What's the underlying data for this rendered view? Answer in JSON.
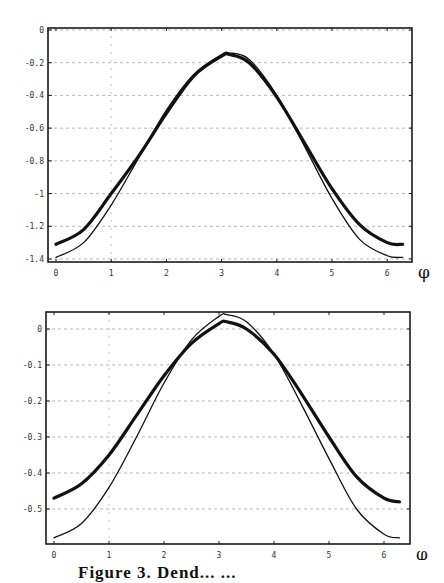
{
  "figure": {
    "caption_partial": "Figure 3. Dend... ...",
    "x_symbol": "φ"
  },
  "chart_data": [
    {
      "type": "line",
      "title": "",
      "xlabel": "φ",
      "ylabel": "",
      "xlim": [
        0,
        6.3
      ],
      "ylim": [
        -1.4,
        0
      ],
      "x_ticks": [
        "0",
        "1",
        "2",
        "3",
        "4",
        "5",
        "6"
      ],
      "y_ticks": [
        "0",
        "-0.2",
        "-0.4",
        "-0.6",
        "-0.8",
        "-1",
        "-1.2",
        "-1.4"
      ],
      "grid": true,
      "legend": null,
      "x": [
        0.0,
        0.5,
        1.0,
        1.5,
        2.0,
        2.5,
        3.0,
        3.14,
        3.5,
        4.0,
        4.5,
        5.0,
        5.5,
        6.0,
        6.28
      ],
      "series": [
        {
          "name": "thick curve",
          "style": "thick",
          "values": [
            -1.31,
            -1.22,
            -1.0,
            -0.77,
            -0.51,
            -0.28,
            -0.16,
            -0.15,
            -0.2,
            -0.41,
            -0.69,
            -0.97,
            -1.19,
            -1.3,
            -1.31
          ]
        },
        {
          "name": "thin curve",
          "style": "thin",
          "values": [
            -1.39,
            -1.3,
            -1.07,
            -0.78,
            -0.49,
            -0.27,
            -0.15,
            -0.14,
            -0.18,
            -0.4,
            -0.71,
            -1.03,
            -1.28,
            -1.38,
            -1.39
          ]
        }
      ]
    },
    {
      "type": "line",
      "title": "",
      "xlabel": "φ",
      "ylabel": "",
      "xlim": [
        0,
        6.3
      ],
      "ylim": [
        -0.58,
        0.05
      ],
      "x_ticks": [
        "0",
        "1",
        "2",
        "3",
        "4",
        "5",
        "6"
      ],
      "y_ticks": [
        "0",
        "-0.1",
        "-0.2",
        "-0.3",
        "-0.4",
        "-0.5"
      ],
      "grid": true,
      "legend": null,
      "x": [
        0.0,
        0.5,
        1.0,
        1.5,
        2.0,
        2.5,
        3.0,
        3.14,
        3.5,
        4.0,
        4.5,
        5.0,
        5.5,
        6.0,
        6.28
      ],
      "series": [
        {
          "name": "thick curve",
          "style": "thick",
          "values": [
            -0.47,
            -0.43,
            -0.35,
            -0.24,
            -0.13,
            -0.04,
            0.015,
            0.02,
            0.0,
            -0.07,
            -0.18,
            -0.3,
            -0.41,
            -0.47,
            -0.48
          ]
        },
        {
          "name": "thin curve",
          "style": "thin",
          "values": [
            -0.58,
            -0.54,
            -0.44,
            -0.3,
            -0.15,
            -0.03,
            0.035,
            0.04,
            0.02,
            -0.07,
            -0.21,
            -0.36,
            -0.5,
            -0.57,
            -0.58
          ]
        }
      ]
    }
  ]
}
